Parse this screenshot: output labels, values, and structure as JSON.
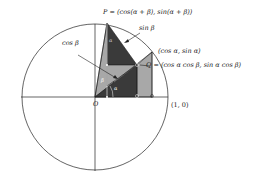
{
  "diagram": {
    "type": "unit circle angle-sum identity",
    "labels": {
      "P": "P = (cos(α + β), sin(α + β))",
      "sin_beta": "sin β",
      "cos_beta": "cos β",
      "point_alpha": "(cos α, sin α)",
      "Q": "Q = (cos α cos β, sin α cos β)",
      "origin": "O",
      "one_zero": "(1, 0)",
      "angle_beta": "β",
      "angle_alpha": "α",
      "angle_alpha_top": "α"
    },
    "colors": {
      "dark_fill": "#3a3a3a",
      "light_fill": "#a8a8a8",
      "line": "#222222"
    }
  }
}
